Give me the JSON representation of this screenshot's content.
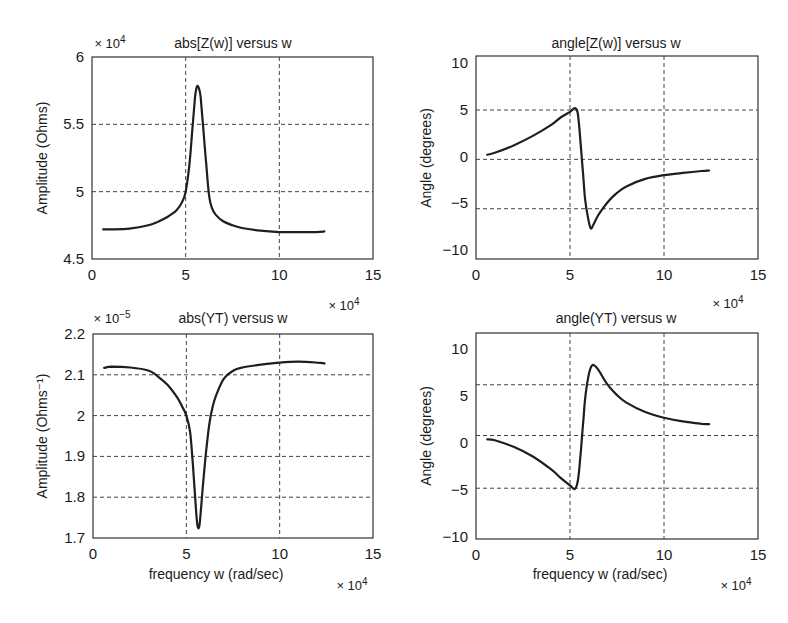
{
  "figure": {
    "background": "#ffffff",
    "line_color": "#1e1e1e"
  },
  "chart_data": [
    {
      "id": "abs_z",
      "type": "line",
      "title": "abs[Z(w)] versus w",
      "xlabel": "",
      "ylabel": "Amplitude (Ohms)",
      "y_multiplier": "× 10",
      "y_multiplier_exp": "4",
      "x_multiplier": "× 10",
      "x_multiplier_exp": "4",
      "xlim": [
        0,
        15
      ],
      "ylim": [
        4.5,
        6
      ],
      "xticks": [
        0,
        5,
        10,
        15
      ],
      "yticks": [
        4.5,
        5,
        5.5,
        6
      ],
      "ytick_labels": [
        "4.5",
        "5",
        "5.5",
        "6"
      ],
      "xgrid": [
        5,
        10
      ],
      "ygrid": [
        5,
        5.5
      ],
      "grid": true,
      "box": {
        "left": 92,
        "top": 57,
        "right": 373,
        "bottom": 259
      },
      "series": [
        {
          "name": "abs[Z(w)]",
          "x": [
            0.6,
            1.0,
            2.0,
            3.0,
            3.5,
            4.0,
            4.5,
            4.8,
            5.0,
            5.2,
            5.35,
            5.5,
            5.6,
            5.7,
            5.8,
            5.95,
            6.1,
            6.25,
            6.4,
            6.6,
            7.0,
            7.5,
            8.0,
            9.0,
            10.0,
            11.0,
            12.0,
            12.4
          ],
          "y": [
            4.72,
            4.72,
            4.725,
            4.75,
            4.775,
            4.81,
            4.86,
            4.92,
            5.0,
            5.2,
            5.45,
            5.7,
            5.78,
            5.77,
            5.7,
            5.45,
            5.2,
            4.97,
            4.88,
            4.83,
            4.78,
            4.75,
            4.73,
            4.71,
            4.7,
            4.7,
            4.7,
            4.705
          ]
        }
      ]
    },
    {
      "id": "angle_z",
      "type": "line",
      "title": "angle[Z(w)] versus w",
      "xlabel": "",
      "ylabel": "Angle (degrees)",
      "x_multiplier": "× 10",
      "x_multiplier_exp": "4",
      "xlim": [
        0,
        15
      ],
      "ylim": [
        -11,
        10.8
      ],
      "xticks": [
        0,
        5,
        10,
        15
      ],
      "yticks": [
        10,
        5,
        0,
        -5,
        -10
      ],
      "ytick_labels": [
        "10",
        "5",
        "0",
        "−5",
        "−10"
      ],
      "xgrid": [
        5,
        10
      ],
      "ygrid": [
        5,
        -0.3,
        -5.6
      ],
      "grid": true,
      "box": {
        "left": 476,
        "top": 56,
        "right": 758,
        "bottom": 259
      },
      "series": [
        {
          "name": "angle[Z(w)]",
          "x": [
            0.6,
            1.0,
            2.0,
            3.0,
            4.0,
            4.5,
            5.0,
            5.25,
            5.4,
            5.5,
            5.6,
            5.7,
            5.8,
            5.95,
            6.1,
            6.25,
            6.5,
            7.0,
            7.5,
            8.0,
            9.0,
            10.0,
            11.0,
            12.0,
            12.4
          ],
          "y": [
            0.2,
            0.4,
            1.2,
            2.2,
            3.4,
            4.2,
            4.8,
            5.2,
            4.8,
            3.0,
            0.5,
            -2.0,
            -4.5,
            -6.5,
            -7.7,
            -7.3,
            -6.3,
            -4.9,
            -3.9,
            -3.2,
            -2.4,
            -2.0,
            -1.75,
            -1.55,
            -1.5
          ]
        }
      ]
    },
    {
      "id": "abs_yt",
      "type": "line",
      "title": "abs(YT) versus w",
      "xlabel": "frequency w (rad/sec)",
      "ylabel": "Amplitude (Ohms⁻¹)",
      "y_multiplier": "× 10",
      "y_multiplier_exp": "−5",
      "x_multiplier": "× 10",
      "x_multiplier_exp": "4",
      "xlim": [
        0,
        15
      ],
      "ylim": [
        1.7,
        2.2
      ],
      "xticks": [
        0,
        5,
        10,
        15
      ],
      "yticks": [
        1.7,
        1.8,
        1.9,
        2.0,
        2.1,
        2.2
      ],
      "ytick_labels": [
        "1.7",
        "1.8",
        "1.9",
        "2",
        "2.1",
        "2.2"
      ],
      "xgrid": [
        5,
        10
      ],
      "ygrid": [
        1.8,
        1.9,
        2.0,
        2.1
      ],
      "grid": true,
      "box": {
        "left": 93,
        "top": 334,
        "right": 373,
        "bottom": 538
      },
      "series": [
        {
          "name": "abs(YT)",
          "x": [
            0.6,
            1.0,
            2.0,
            3.0,
            3.5,
            4.0,
            4.5,
            4.8,
            5.0,
            5.2,
            5.35,
            5.5,
            5.6,
            5.7,
            5.8,
            5.95,
            6.1,
            6.25,
            6.4,
            6.6,
            7.0,
            7.5,
            8.0,
            9.0,
            10.0,
            11.0,
            12.0,
            12.4
          ],
          "y": [
            2.117,
            2.12,
            2.118,
            2.11,
            2.095,
            2.075,
            2.045,
            2.02,
            2.0,
            1.96,
            1.88,
            1.78,
            1.73,
            1.73,
            1.78,
            1.86,
            1.93,
            1.985,
            2.02,
            2.05,
            2.09,
            2.11,
            2.118,
            2.125,
            2.13,
            2.132,
            2.13,
            2.128
          ]
        }
      ]
    },
    {
      "id": "angle_yt",
      "type": "line",
      "title": "angle(YT) versus w",
      "xlabel": "frequency w (rad/sec)",
      "ylabel": "Angle (degrees)",
      "x_multiplier": "× 10",
      "x_multiplier_exp": "4",
      "xlim": [
        0,
        15
      ],
      "ylim": [
        -10.2,
        11.7
      ],
      "xticks": [
        0,
        5,
        10,
        15
      ],
      "yticks": [
        10,
        5,
        0,
        -5,
        -10
      ],
      "ytick_labels": [
        "10",
        "5",
        "0",
        "−5",
        "−10"
      ],
      "xgrid": [
        5,
        10
      ],
      "ygrid": [
        6.2,
        0.8,
        -4.8
      ],
      "grid": true,
      "box": {
        "left": 476,
        "top": 333,
        "right": 758,
        "bottom": 539
      },
      "series": [
        {
          "name": "angle(YT)",
          "x": [
            0.6,
            1.0,
            2.0,
            3.0,
            4.0,
            4.5,
            5.0,
            5.25,
            5.4,
            5.5,
            5.6,
            5.7,
            5.8,
            5.95,
            6.1,
            6.25,
            6.5,
            7.0,
            7.5,
            8.0,
            9.0,
            10.0,
            11.0,
            12.0,
            12.4
          ],
          "y": [
            0.4,
            0.3,
            -0.4,
            -1.4,
            -2.8,
            -3.7,
            -4.5,
            -4.9,
            -4.2,
            -2.6,
            -0.3,
            2.2,
            4.6,
            6.8,
            8.0,
            8.3,
            7.8,
            6.2,
            5.1,
            4.3,
            3.3,
            2.7,
            2.3,
            2.05,
            2.0
          ]
        }
      ]
    }
  ]
}
